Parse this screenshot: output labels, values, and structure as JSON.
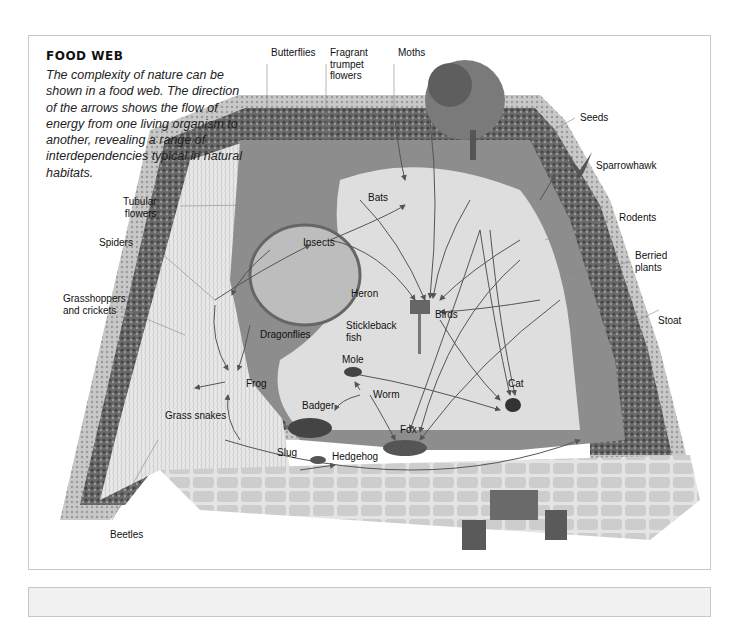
{
  "title": "FOOD WEB",
  "description": "The complexity of nature can be shown in a food web. The direction of the arrows shows the flow of energy from one living organism to another, revealing a range of interdependencies typical in natural habitats.",
  "labels": {
    "butterflies": "Butterflies",
    "fragrant_trumpet_flowers": "Fragrant\ntrumpet\nflowers",
    "moths": "Moths",
    "seeds": "Seeds",
    "sparrowhawk": "Sparrowhawk",
    "tubular_flowers": "Tubular\nflowers",
    "bats": "Bats",
    "rodents": "Rodents",
    "berried_plants": "Berried\nplants",
    "spiders": "Spiders",
    "insects": "Insects",
    "grasshoppers": "Grasshoppers\nand crickets",
    "heron": "Heron",
    "birds": "Birds",
    "dragonflies": "Dragonflies",
    "stickleback": "Stickleback\nfish",
    "stoat": "Stoat",
    "frog": "Frog",
    "mole": "Mole",
    "worm": "Worm",
    "cat": "Cat",
    "grass_snakes": "Grass snakes",
    "badger": "Badger",
    "fox": "Fox",
    "slug": "Slug",
    "hedgehog": "Hedgehog",
    "beetles": "Beetles"
  },
  "colors": {
    "hedge_dark": "#3a3a3a",
    "hedge_light": "#9a9a9a",
    "lawn": "#e2e2e2",
    "paving": "#cfcfcf",
    "arrow": "#555555",
    "panel": "#f1f1f1"
  }
}
